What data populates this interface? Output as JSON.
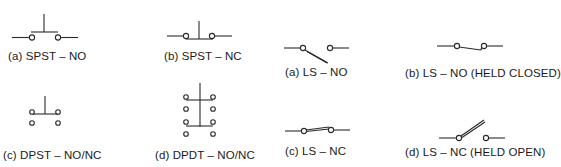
{
  "figure": {
    "stroke_color": "#2a2a2a",
    "background": "#ffffff",
    "panels": [
      {
        "id": "spst-no",
        "label": "(a) SPST – NO",
        "type": "pushbutton",
        "contacts": "normally open"
      },
      {
        "id": "spst-nc",
        "label": "(b) SPST – NC",
        "type": "pushbutton",
        "contacts": "normally closed"
      },
      {
        "id": "ls-no",
        "label": "(a) LS – NO",
        "type": "limit switch",
        "contacts": "normally open"
      },
      {
        "id": "ls-no-held-closed",
        "label": "(b) LS – NO (HELD CLOSED)",
        "type": "limit switch",
        "contacts": "normally open, held closed"
      },
      {
        "id": "dpst-no-nc",
        "label": "(c) DPST – NO/NC",
        "type": "pushbutton",
        "contacts": "double pole single throw"
      },
      {
        "id": "dpdt-no-nc",
        "label": "(d) DPDT – NO/NC",
        "type": "pushbutton",
        "contacts": "double pole double throw"
      },
      {
        "id": "ls-nc",
        "label": "(c) LS – NC",
        "type": "limit switch",
        "contacts": "normally closed"
      },
      {
        "id": "ls-nc-held-open",
        "label": "(d) LS – NC (HELD OPEN)",
        "type": "limit switch",
        "contacts": "normally closed, held open"
      }
    ]
  }
}
